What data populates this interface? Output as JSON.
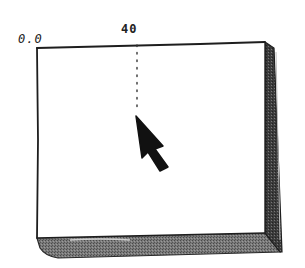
{
  "diagram": {
    "type": "sketch-screen-with-cursor",
    "origin_label": "0.0",
    "x_marker_label": "40",
    "colors": {
      "ink": "#1e1e1e",
      "edge_shade": "#6e6e6e",
      "edge_dark": "#3a3a3a",
      "surface": "#ffffff"
    }
  }
}
